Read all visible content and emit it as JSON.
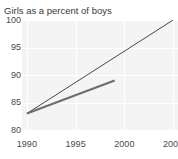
{
  "chart_data": {
    "type": "line",
    "title": "Girls as a percent of boys",
    "xlabel": "",
    "ylabel": "",
    "xlim": [
      1989.5,
      2005.5
    ],
    "ylim": [
      80,
      100
    ],
    "xticks": [
      "1990",
      "1995",
      "2000",
      "2005"
    ],
    "xtick_values": [
      1990,
      1995,
      2000,
      2005
    ],
    "yticks": [
      "80",
      "85",
      "90",
      "95",
      "100"
    ],
    "ytick_values": [
      80,
      85,
      90,
      95,
      100
    ],
    "grid": "light gridlines on shaded plot background",
    "legend": "none",
    "series": [
      {
        "name": "target-trend",
        "style": "thin dark line",
        "color": "#333333",
        "width": 0.9,
        "x": [
          1990,
          2005
        ],
        "values": [
          83.0,
          100.0
        ]
      },
      {
        "name": "actual-trend",
        "style": "thick gray line",
        "color": "#6e6e6e",
        "width": 2.2,
        "x": [
          1990,
          1999
        ],
        "values": [
          83.0,
          89.0
        ]
      }
    ]
  },
  "chart": {
    "title": "Girls as a percent of boys",
    "clipped_text_above": "",
    "colors": {
      "plot_background": "#f4f4f4",
      "gridline": "#ffffff",
      "tick_label": "#4a4a4a",
      "title": "#3b3b3b",
      "series_thin": "#333333",
      "series_thick": "#6e6e6e"
    }
  }
}
